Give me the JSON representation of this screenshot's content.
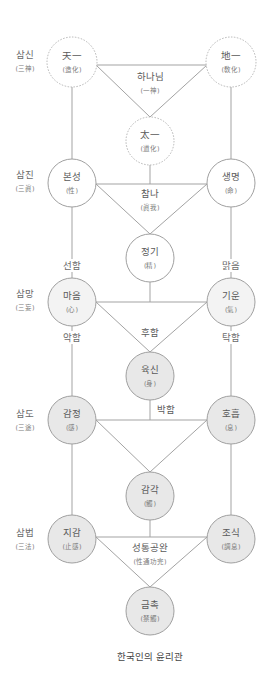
{
  "title": "한국인의 윤리관",
  "row_labels": [
    {
      "label": "삼신",
      "hanja": "(三神)"
    },
    {
      "label": "삼진",
      "hanja": "(三眞)"
    },
    {
      "label": "삼망",
      "hanja": "(三妄)"
    },
    {
      "label": "삼도",
      "hanja": "(三途)"
    },
    {
      "label": "삼법",
      "hanja": "(三法)"
    }
  ],
  "nodes": {
    "cheon_il": {
      "label": "天一",
      "sub": "(造化)"
    },
    "ji_il": {
      "label": "地一",
      "sub": "(敎化)"
    },
    "tae_il": {
      "label": "太一",
      "sub": "(道化)"
    },
    "bonseong": {
      "label": "본성",
      "sub": "(性)"
    },
    "saengmyeong": {
      "label": "생명",
      "sub": "(命)"
    },
    "jeonggi": {
      "label": "정기",
      "sub": "(精)"
    },
    "maeum": {
      "label": "마음",
      "sub": "(心)"
    },
    "giun": {
      "label": "기운",
      "sub": "(氣)"
    },
    "yuksin": {
      "label": "육신",
      "sub": "(身)"
    },
    "gamjeong": {
      "label": "감정",
      "sub": "(感)"
    },
    "hoheup": {
      "label": "호흡",
      "sub": "(息)"
    },
    "gamgak": {
      "label": "감각",
      "sub": "(觸)"
    },
    "jigam": {
      "label": "지감",
      "sub": "(止感)"
    },
    "josik": {
      "label": "조식",
      "sub": "(調息)"
    },
    "geumchok": {
      "label": "금촉",
      "sub": "(禁觸)"
    }
  },
  "center_labels": {
    "hananim": {
      "label": "하나님",
      "sub": "(一神)"
    },
    "chamna": {
      "label": "참나",
      "sub": "(眞我)"
    },
    "huham": {
      "label": "후함"
    },
    "bakham": {
      "label": "박함"
    },
    "seongtong": {
      "label": "성통공완",
      "sub": "(性通功完)"
    }
  },
  "edge_labels": {
    "seonham": "선함",
    "malgeum": "맑음",
    "akham": "악함",
    "takham": "탁함"
  },
  "colors": {
    "line": "#a3a3a3",
    "fill_light": "#f3f3f3",
    "fill_gray": "#e8e8e8",
    "text": "#5a5a5a"
  }
}
